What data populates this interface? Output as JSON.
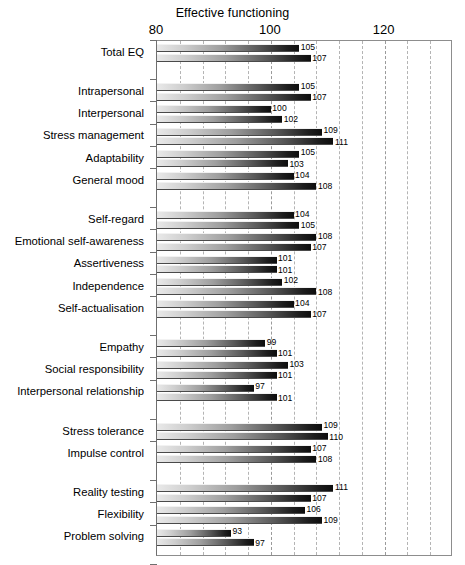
{
  "chart_data": {
    "type": "bar",
    "title": "Effective functioning",
    "xlabel": "",
    "ylabel": "",
    "xlim": [
      80,
      132
    ],
    "xticks": [
      80,
      100,
      120
    ],
    "xticklabels": [
      "80",
      "100",
      "120"
    ],
    "grid": true,
    "gridlines_minor_step": 4,
    "orientation": "horizontal",
    "legend": "none",
    "series": [
      {
        "name": "upper",
        "values": [
          105,
          105,
          100,
          109,
          105,
          104,
          104,
          108,
          101,
          102,
          104,
          99,
          103,
          97,
          109,
          107,
          111,
          106,
          93,
          102,
          104
        ]
      },
      {
        "name": "lower",
        "values": [
          107,
          107,
          102,
          111,
          103,
          108,
          105,
          107,
          101,
          108,
          107,
          101,
          101,
          101,
          110,
          108,
          107,
          109,
          97,
          105,
          109
        ]
      }
    ],
    "categories": [
      "Total EQ",
      "Intrapersonal",
      "Interpersonal",
      "Stress management",
      "Adaptability",
      "General mood",
      "Self-regard",
      "Emotional self-awareness",
      "Assertiveness",
      "Independence",
      "Self-actualisation",
      "Empathy",
      "Social responsibility",
      "Interpersonal relationship",
      "Stress tolerance",
      "Impulse control",
      "Reality testing",
      "Flexibility",
      "Problem solving",
      "Optimism",
      "Happiness"
    ],
    "groups": [
      {
        "gap_before": false,
        "items": [
          0
        ]
      },
      {
        "gap_before": true,
        "items": [
          1,
          2,
          3,
          4,
          5
        ]
      },
      {
        "gap_before": true,
        "items": [
          6,
          7,
          8,
          9,
          10
        ]
      },
      {
        "gap_before": true,
        "items": [
          11,
          12,
          13
        ]
      },
      {
        "gap_before": true,
        "items": [
          14,
          15
        ]
      },
      {
        "gap_before": true,
        "items": [
          16,
          17,
          18
        ]
      },
      {
        "gap_before": true,
        "items": [
          19,
          20
        ]
      }
    ]
  },
  "colors": {
    "bar_light": "#e9e9e9",
    "bar_dark": "#0d0d0d",
    "grid": "#b4b4b4",
    "frame": "#8d8d8d",
    "text": "#000000",
    "background": "#ffffff"
  }
}
